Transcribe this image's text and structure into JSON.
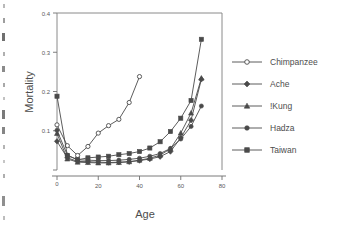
{
  "chart_data": {
    "type": "line",
    "title": "",
    "xlabel": "Age",
    "ylabel": "Mortality",
    "xlim": [
      0,
      80
    ],
    "ylim": [
      0,
      0.4
    ],
    "xticks": [
      0,
      20,
      40,
      60,
      80
    ],
    "xtick_labels": [
      "0",
      "20",
      "40",
      "60",
      "80"
    ],
    "yticks": [
      0,
      0.1,
      0.2,
      0.3,
      0.4
    ],
    "ytick_labels": [
      "0",
      "0.1",
      "0.2",
      "0.3",
      "0.4"
    ],
    "grid": false,
    "legend_position": "right",
    "series": [
      {
        "name": "Chimpanzee",
        "marker": "open-circle",
        "color": "#4a4a4a",
        "x": [
          0,
          5,
          10,
          15,
          20,
          25,
          30,
          35,
          40
        ],
        "y": [
          0.115,
          0.062,
          0.037,
          0.06,
          0.094,
          0.113,
          0.129,
          0.172,
          0.238
        ]
      },
      {
        "name": "Ache",
        "marker": "filled-diamond",
        "color": "#4a4a4a",
        "x": [
          0,
          5,
          10,
          15,
          20,
          25,
          30,
          35,
          40,
          45,
          50,
          55,
          60,
          65,
          70
        ],
        "y": [
          0.073,
          0.031,
          0.022,
          0.021,
          0.02,
          0.019,
          0.02,
          0.021,
          0.024,
          0.028,
          0.034,
          0.047,
          0.082,
          0.127,
          0.231
        ]
      },
      {
        "name": "!Kung",
        "marker": "filled-triangle",
        "color": "#4a4a4a",
        "x": [
          0,
          5,
          10,
          15,
          20,
          25,
          30,
          35,
          40,
          45,
          50,
          55,
          60,
          65,
          70
        ],
        "y": [
          0.093,
          0.028,
          0.02,
          0.019,
          0.018,
          0.018,
          0.019,
          0.021,
          0.025,
          0.03,
          0.038,
          0.054,
          0.094,
          0.145,
          0.234
        ]
      },
      {
        "name": "Hadza",
        "marker": "filled-circle",
        "color": "#4a4a4a",
        "x": [
          0,
          5,
          10,
          15,
          20,
          25,
          30,
          35,
          40,
          45,
          50,
          55,
          60,
          65,
          70
        ],
        "y": [
          0.101,
          0.038,
          0.026,
          0.025,
          0.024,
          0.024,
          0.025,
          0.027,
          0.03,
          0.035,
          0.042,
          0.055,
          0.079,
          0.111,
          0.163
        ]
      },
      {
        "name": "Taiwan",
        "marker": "filled-square",
        "color": "#4a4a4a",
        "x": [
          0,
          5,
          10,
          15,
          20,
          25,
          30,
          35,
          40,
          45,
          50,
          55,
          60,
          65,
          70
        ],
        "y": [
          0.188,
          0.037,
          0.026,
          0.031,
          0.033,
          0.035,
          0.039,
          0.042,
          0.047,
          0.056,
          0.072,
          0.098,
          0.132,
          0.177,
          0.333
        ]
      }
    ]
  },
  "legend": {
    "items": [
      {
        "label": "Chimpanzee"
      },
      {
        "label": "Ache"
      },
      {
        "label": "!Kung"
      },
      {
        "label": "Hadza"
      },
      {
        "label": "Taiwan"
      }
    ]
  }
}
